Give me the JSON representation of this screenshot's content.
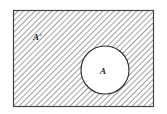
{
  "diagram": {
    "type": "venn",
    "universal_set": {
      "label": "A'",
      "shaded": true
    },
    "set": {
      "label": "A",
      "shaded": false
    },
    "colors": {
      "stroke": "#444444",
      "hatch": "#666666",
      "background": "#ffffff"
    }
  }
}
